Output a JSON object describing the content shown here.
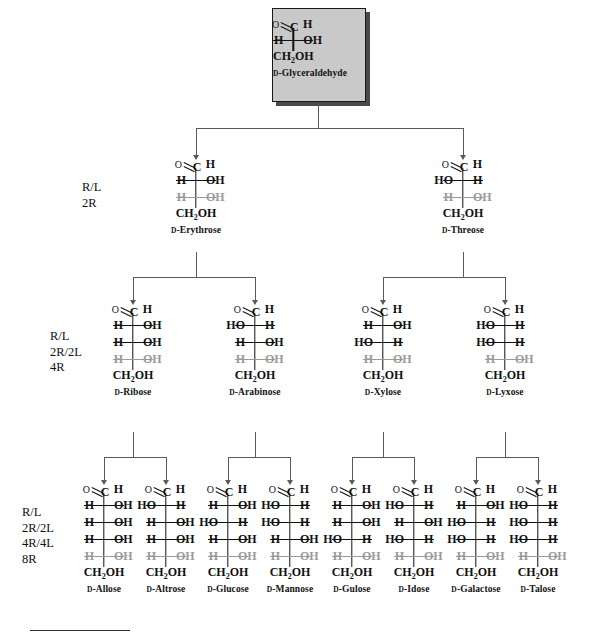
{
  "diagram": {
    "title_sugar": "D-Glyceraldehyde",
    "root_box_fill": "#c9c9c9",
    "inherited_color": "#9a9a9a",
    "bond_color": "#111111",
    "connector_color": "#5a5a5a"
  },
  "row_labels": [
    {
      "id": "row2",
      "lines": [
        "R/L",
        "2R"
      ]
    },
    {
      "id": "row3",
      "lines": [
        "R/L",
        "2R/2L",
        "4R"
      ]
    },
    {
      "id": "row4",
      "lines": [
        "R/L",
        "2R/2L",
        "4R/4L",
        "8R"
      ]
    }
  ],
  "atoms": {
    "aldehyde_o": "O",
    "aldehyde_c": "C",
    "aldehyde_h": "H",
    "terminal": "CH2OH",
    "terminal_head": "CH",
    "terminal_sub": "2",
    "terminal_tail": "OH",
    "h": "H",
    "oh": "OH",
    "ho": "HO"
  },
  "sugars": [
    {
      "id": "glyceraldehyde",
      "name": "D-Glyceraldehyde",
      "name_prefix": "D",
      "name_rest": "-Glyceraldehyde",
      "level": 1,
      "centers": [
        {
          "left": "H",
          "right": "OH",
          "inherited": false
        }
      ]
    },
    {
      "id": "erythrose",
      "name": "D-Erythrose",
      "name_prefix": "D",
      "name_rest": "-Erythrose",
      "level": 2,
      "centers": [
        {
          "left": "H",
          "right": "OH",
          "inherited": false
        },
        {
          "left": "H",
          "right": "OH",
          "inherited": true
        }
      ]
    },
    {
      "id": "threose",
      "name": "D-Threose",
      "name_prefix": "D",
      "name_rest": "-Threose",
      "level": 2,
      "centers": [
        {
          "left": "HO",
          "right": "H",
          "inherited": false
        },
        {
          "left": "H",
          "right": "OH",
          "inherited": true
        }
      ]
    },
    {
      "id": "ribose",
      "name": "D-Ribose",
      "name_prefix": "D",
      "name_rest": "-Ribose",
      "level": 3,
      "centers": [
        {
          "left": "H",
          "right": "OH",
          "inherited": false
        },
        {
          "left": "H",
          "right": "OH",
          "inherited": false
        },
        {
          "left": "H",
          "right": "OH",
          "inherited": true
        }
      ]
    },
    {
      "id": "arabinose",
      "name": "D-Arabinose",
      "name_prefix": "D",
      "name_rest": "-Arabinose",
      "level": 3,
      "centers": [
        {
          "left": "HO",
          "right": "H",
          "inherited": false
        },
        {
          "left": "H",
          "right": "OH",
          "inherited": false
        },
        {
          "left": "H",
          "right": "OH",
          "inherited": true
        }
      ]
    },
    {
      "id": "xylose",
      "name": "D-Xylose",
      "name_prefix": "D",
      "name_rest": "-Xylose",
      "level": 3,
      "centers": [
        {
          "left": "H",
          "right": "OH",
          "inherited": false
        },
        {
          "left": "HO",
          "right": "H",
          "inherited": false
        },
        {
          "left": "H",
          "right": "OH",
          "inherited": true
        }
      ]
    },
    {
      "id": "lyxose",
      "name": "D-Lyxose",
      "name_prefix": "D",
      "name_rest": "-Lyxose",
      "level": 3,
      "centers": [
        {
          "left": "HO",
          "right": "H",
          "inherited": false
        },
        {
          "left": "HO",
          "right": "H",
          "inherited": false
        },
        {
          "left": "H",
          "right": "OH",
          "inherited": true
        }
      ]
    },
    {
      "id": "allose",
      "name": "D-Allose",
      "name_prefix": "D",
      "name_rest": "-Allose",
      "level": 4,
      "centers": [
        {
          "left": "H",
          "right": "OH",
          "inherited": false
        },
        {
          "left": "H",
          "right": "OH",
          "inherited": false
        },
        {
          "left": "H",
          "right": "OH",
          "inherited": false
        },
        {
          "left": "H",
          "right": "OH",
          "inherited": true
        }
      ]
    },
    {
      "id": "altrose",
      "name": "D-Altrose",
      "name_prefix": "D",
      "name_rest": "-Altrose",
      "level": 4,
      "centers": [
        {
          "left": "HO",
          "right": "H",
          "inherited": false
        },
        {
          "left": "H",
          "right": "OH",
          "inherited": false
        },
        {
          "left": "H",
          "right": "OH",
          "inherited": false
        },
        {
          "left": "H",
          "right": "OH",
          "inherited": true
        }
      ]
    },
    {
      "id": "glucose",
      "name": "D-Glucose",
      "name_prefix": "D",
      "name_rest": "-Glucose",
      "level": 4,
      "centers": [
        {
          "left": "H",
          "right": "OH",
          "inherited": false
        },
        {
          "left": "HO",
          "right": "H",
          "inherited": false
        },
        {
          "left": "H",
          "right": "OH",
          "inherited": false
        },
        {
          "left": "H",
          "right": "OH",
          "inherited": true
        }
      ]
    },
    {
      "id": "mannose",
      "name": "D-Mannose",
      "name_prefix": "D",
      "name_rest": "-Mannose",
      "level": 4,
      "centers": [
        {
          "left": "HO",
          "right": "H",
          "inherited": false
        },
        {
          "left": "HO",
          "right": "H",
          "inherited": false
        },
        {
          "left": "H",
          "right": "OH",
          "inherited": false
        },
        {
          "left": "H",
          "right": "OH",
          "inherited": true
        }
      ]
    },
    {
      "id": "gulose",
      "name": "D-Gulose",
      "name_prefix": "D",
      "name_rest": "-Gulose",
      "level": 4,
      "centers": [
        {
          "left": "H",
          "right": "OH",
          "inherited": false
        },
        {
          "left": "H",
          "right": "OH",
          "inherited": false
        },
        {
          "left": "HO",
          "right": "H",
          "inherited": false
        },
        {
          "left": "H",
          "right": "OH",
          "inherited": true
        }
      ]
    },
    {
      "id": "idose",
      "name": "D-Idose",
      "name_prefix": "D",
      "name_rest": "-Idose",
      "level": 4,
      "centers": [
        {
          "left": "HO",
          "right": "H",
          "inherited": false
        },
        {
          "left": "H",
          "right": "OH",
          "inherited": false
        },
        {
          "left": "HO",
          "right": "H",
          "inherited": false
        },
        {
          "left": "H",
          "right": "OH",
          "inherited": true
        }
      ]
    },
    {
      "id": "galactose",
      "name": "D-Galactose",
      "name_prefix": "D",
      "name_rest": "-Galactose",
      "level": 4,
      "centers": [
        {
          "left": "H",
          "right": "OH",
          "inherited": false
        },
        {
          "left": "HO",
          "right": "H",
          "inherited": false
        },
        {
          "left": "HO",
          "right": "H",
          "inherited": false
        },
        {
          "left": "H",
          "right": "OH",
          "inherited": true
        }
      ]
    },
    {
      "id": "talose",
      "name": "D-Talose",
      "name_prefix": "D",
      "name_rest": "-Talose",
      "level": 4,
      "centers": [
        {
          "left": "HO",
          "right": "H",
          "inherited": false
        },
        {
          "left": "HO",
          "right": "H",
          "inherited": false
        },
        {
          "left": "HO",
          "right": "H",
          "inherited": false
        },
        {
          "left": "H",
          "right": "OH",
          "inherited": true
        }
      ]
    }
  ],
  "layout": {
    "positions": {
      "glyceraldehyde": 318,
      "erythrose": 196,
      "threose": 463,
      "ribose": 133,
      "arabinose": 255,
      "xylose": 383,
      "lyxose": 505,
      "allose": 104,
      "altrose": 166,
      "glucose": 228,
      "mannose": 290,
      "gulose": 352,
      "idose": 414,
      "galactose": 476,
      "talose": 538
    },
    "level_tops": {
      "l1": 20,
      "l2": 158,
      "l3": 303,
      "l4": 483
    }
  }
}
